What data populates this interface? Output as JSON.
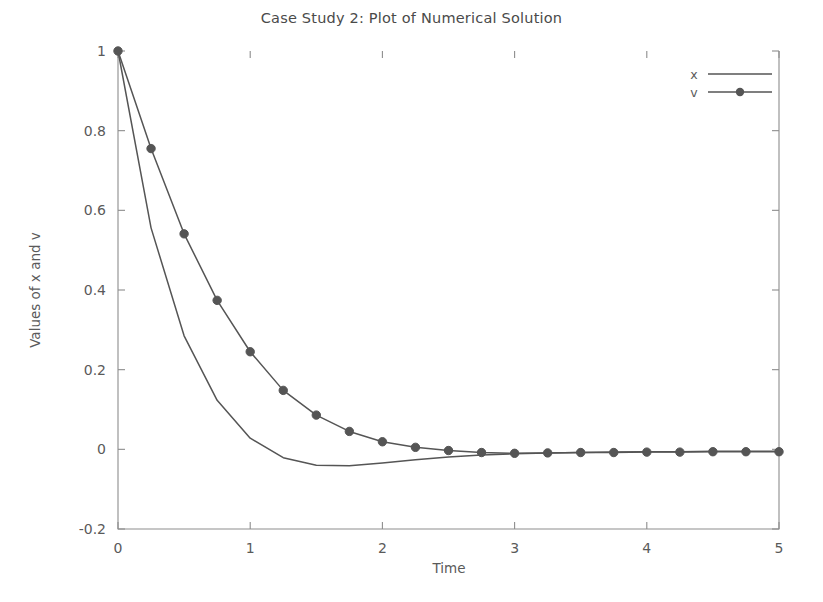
{
  "chart_data": {
    "type": "line",
    "title": "Case Study 2: Plot of Numerical Solution",
    "xlabel": "Time",
    "ylabel": "Values of x and v",
    "xlim": [
      0,
      5
    ],
    "ylim": [
      -0.2,
      1.0
    ],
    "xticks": [
      "0",
      "1",
      "2",
      "3",
      "4",
      "5"
    ],
    "xtick_values": [
      0,
      1,
      2,
      3,
      4,
      5
    ],
    "yticks": [
      "-0.2",
      "0",
      "0.2",
      "0.4",
      "0.6",
      "0.8",
      "1"
    ],
    "ytick_values": [
      -0.2,
      0,
      0.2,
      0.4,
      0.6,
      0.8,
      1.0
    ],
    "grid": false,
    "legend_position": "top-right",
    "line_color": "#555555",
    "marker_color": "#555555",
    "axis_color": "#8d8d8d",
    "text_color": "#5a5a5a",
    "x": [
      0,
      0.25,
      0.5,
      0.75,
      1.0,
      1.25,
      1.5,
      1.75,
      2.0,
      2.25,
      2.5,
      2.75,
      3.0,
      3.25,
      3.5,
      3.75,
      4.0,
      4.25,
      4.5,
      4.75,
      5.0
    ],
    "series": [
      {
        "name": "x",
        "marker": "none",
        "values": [
          1.0,
          0.556,
          0.285,
          0.123,
          0.028,
          -0.021,
          -0.04,
          -0.041,
          -0.034,
          -0.026,
          -0.019,
          -0.014,
          -0.011,
          -0.009,
          -0.008,
          -0.007,
          -0.006,
          -0.006,
          -0.005,
          -0.005,
          -0.005
        ]
      },
      {
        "name": "v",
        "marker": "filled-circle",
        "values": [
          1.0,
          0.755,
          0.541,
          0.374,
          0.245,
          0.148,
          0.086,
          0.045,
          0.019,
          0.005,
          -0.003,
          -0.008,
          -0.01,
          -0.009,
          -0.008,
          -0.008,
          -0.007,
          -0.007,
          -0.006,
          -0.006,
          -0.006
        ]
      }
    ],
    "legend": [
      {
        "label": "x",
        "marker": "none"
      },
      {
        "label": "v",
        "marker": "filled-circle"
      }
    ]
  }
}
